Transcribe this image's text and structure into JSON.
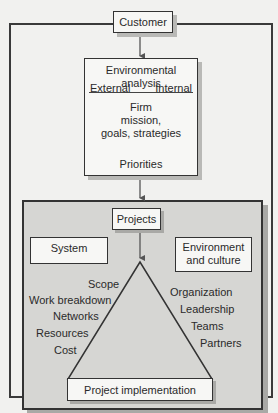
{
  "diagram": {
    "customer": "Customer",
    "env_analysis": {
      "title": "Environmental analysis",
      "external": "External",
      "internal": "Internal",
      "firm_line1": "Firm",
      "firm_line2": "mission,",
      "firm_line3": "goals, strategies",
      "priorities": "Priorities"
    },
    "projects_panel": {
      "projects": "Projects",
      "system": "System",
      "environment_line1": "Environment",
      "environment_line2": "and culture",
      "left_labels": [
        "Scope",
        "Work breakdown",
        "Networks",
        "Resources",
        "Cost"
      ],
      "right_labels": [
        "Organization",
        "Leadership",
        "Teams",
        "Partners"
      ],
      "implementation": "Project implementation"
    }
  }
}
